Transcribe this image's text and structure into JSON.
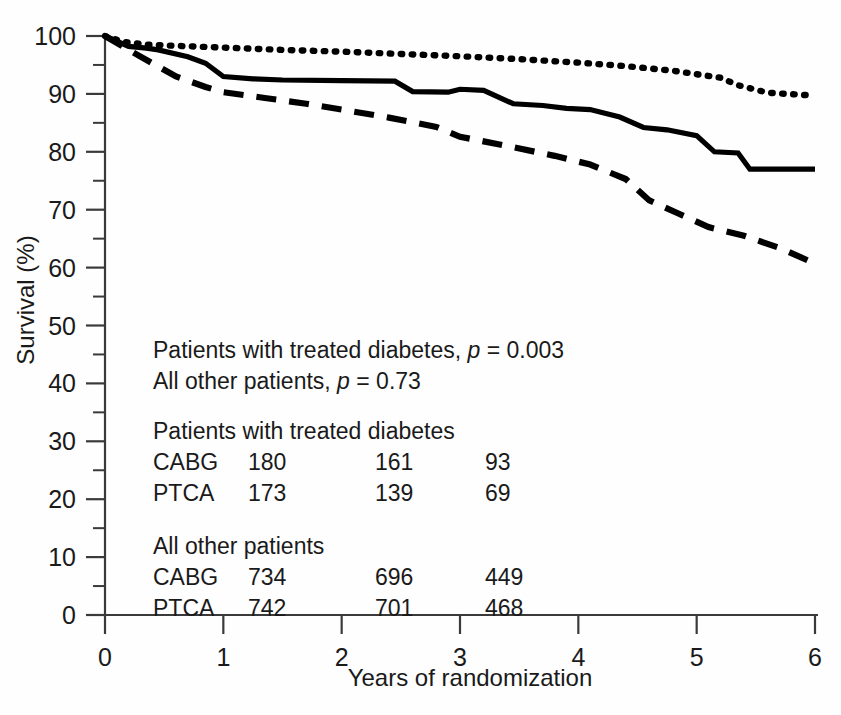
{
  "chart_data": {
    "type": "line",
    "title": "",
    "xlabel": "Years of randomization",
    "ylabel": "Survival (%)",
    "xlim": [
      0,
      6
    ],
    "ylim": [
      0,
      100
    ],
    "grid": false,
    "legend_position": "none",
    "x_ticks": [
      "0",
      "1",
      "2",
      "3",
      "4",
      "5",
      "6"
    ],
    "y_ticks": [
      "0",
      "10",
      "20",
      "30",
      "40",
      "50",
      "60",
      "70",
      "80",
      "90",
      "100"
    ],
    "y_minor_ticks": [
      5,
      15,
      25,
      35,
      45,
      55,
      65,
      75,
      85,
      95
    ],
    "series": [
      {
        "name": "All other patients",
        "style": "dotted",
        "x": [
          0,
          0.15,
          0.35,
          0.6,
          1.0,
          1.5,
          2.0,
          2.5,
          3.0,
          3.5,
          4.0,
          4.4,
          4.8,
          5.2,
          5.35,
          5.6,
          6.0
        ],
        "values": [
          100,
          99.0,
          98.5,
          98.3,
          98.0,
          97.6,
          97.3,
          96.9,
          96.5,
          96.0,
          95.4,
          94.8,
          94.0,
          92.8,
          91.5,
          90.2,
          89.7
        ]
      },
      {
        "name": "All other patients CABG-PTCA solid",
        "style": "solid",
        "x": [
          0,
          0.2,
          0.35,
          0.45,
          0.7,
          0.85,
          1.0,
          1.25,
          1.5,
          2.0,
          2.45,
          2.6,
          2.9,
          3.0,
          3.2,
          3.45,
          3.7,
          3.9,
          4.1,
          4.35,
          4.55,
          4.75,
          5.0,
          5.15,
          5.35,
          5.45,
          6.0
        ],
        "values": [
          100,
          98.2,
          97.9,
          97.6,
          96.4,
          95.3,
          93.0,
          92.6,
          92.4,
          92.3,
          92.2,
          90.4,
          90.3,
          90.8,
          90.6,
          88.3,
          88.0,
          87.5,
          87.3,
          86.0,
          84.2,
          83.8,
          82.8,
          80.0,
          79.8,
          77.0,
          77.0
        ]
      },
      {
        "name": "Patients with treated diabetes",
        "style": "dashed",
        "x": [
          0,
          0.2,
          0.4,
          0.6,
          0.85,
          1.0,
          1.35,
          1.7,
          2.0,
          2.4,
          2.8,
          3.0,
          3.4,
          3.8,
          4.1,
          4.4,
          4.6,
          4.85,
          5.1,
          5.4,
          5.7,
          6.0
        ],
        "values": [
          100,
          97.6,
          95.3,
          93.0,
          91.2,
          90.3,
          89.3,
          88.3,
          87.3,
          85.9,
          84.3,
          82.6,
          81.0,
          79.3,
          77.8,
          75.3,
          71.6,
          69.3,
          67.0,
          65.5,
          63.4,
          60.7
        ]
      }
    ],
    "annotations": {
      "p_value_lines": [
        {
          "prefix": "Patients with treated diabetes, ",
          "italic": "p",
          "suffix": " = 0.003"
        },
        {
          "prefix": "All other patients, ",
          "italic": "p",
          "suffix": " = 0.73"
        }
      ],
      "risk_tables": [
        {
          "heading": "Patients with treated diabetes",
          "rows": [
            {
              "label": "CABG",
              "counts": [
                "180",
                "161",
                "93"
              ]
            },
            {
              "label": "PTCA",
              "counts": [
                "173",
                "139",
                "69"
              ]
            }
          ]
        },
        {
          "heading": "All other patients",
          "rows": [
            {
              "label": "CABG",
              "counts": [
                "734",
                "696",
                "449"
              ]
            },
            {
              "label": "PTCA",
              "counts": [
                "742",
                "701",
                "468"
              ]
            }
          ]
        }
      ]
    },
    "colors": {
      "line": "#000000",
      "axis": "#3a3a3a",
      "text": "#1a1a1a",
      "background": "#ffffff"
    }
  }
}
